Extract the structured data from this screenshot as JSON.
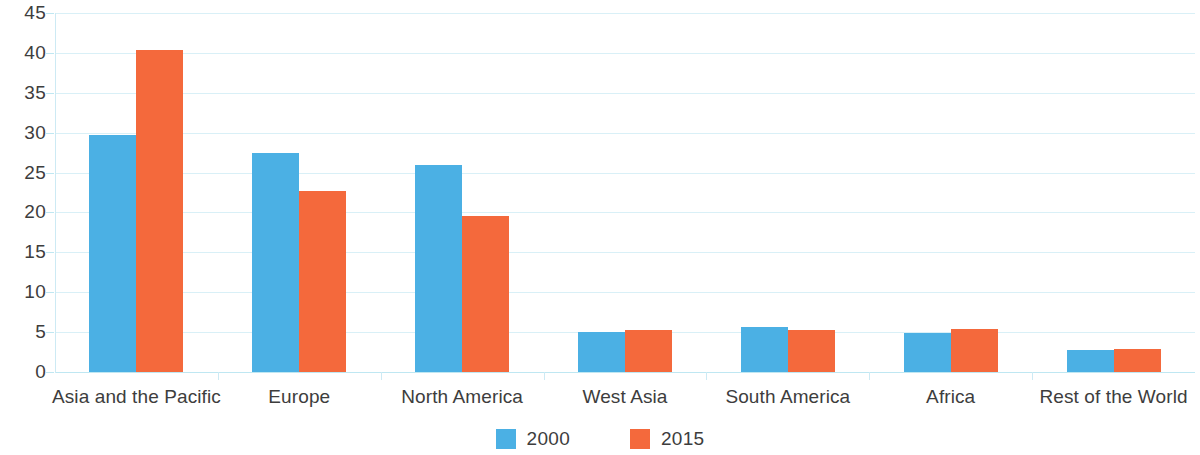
{
  "chart_data": {
    "type": "bar",
    "title": "",
    "subtitle": "",
    "xlabel": "",
    "ylabel": "",
    "ylim": [
      0,
      45
    ],
    "ytick_step": 5,
    "yticks": [
      "0",
      "5",
      "10",
      "15",
      "20",
      "25",
      "30",
      "35",
      "40",
      "45"
    ],
    "grid": true,
    "legend_position": "bottom-center",
    "categories": [
      "Asia and the Pacific",
      "Europe",
      "North America",
      "West Asia",
      "South America",
      "Africa",
      "Rest of the World"
    ],
    "series": [
      {
        "name": "2000",
        "color": "#4bb0e4",
        "values": [
          29.7,
          27.5,
          26.0,
          5.0,
          5.6,
          4.9,
          2.8
        ]
      },
      {
        "name": "2015",
        "color": "#f4693c",
        "values": [
          40.4,
          22.7,
          19.6,
          5.3,
          5.3,
          5.4,
          2.9
        ]
      }
    ]
  },
  "axis": {
    "y_tick_labels": [
      "45",
      "40",
      "35",
      "30",
      "25",
      "20",
      "15",
      "10",
      "5",
      "0"
    ]
  },
  "legend": {
    "items": [
      {
        "label": "2000",
        "color": "#4bb0e4"
      },
      {
        "label": "2015",
        "color": "#f4693c"
      }
    ]
  },
  "colors": {
    "series_2000": "#4bb0e4",
    "series_2015": "#f4693c",
    "gridline": "#d9f0f7",
    "axis": "#cdeaf4",
    "text": "#3d3d3d",
    "background": "#ffffff"
  }
}
